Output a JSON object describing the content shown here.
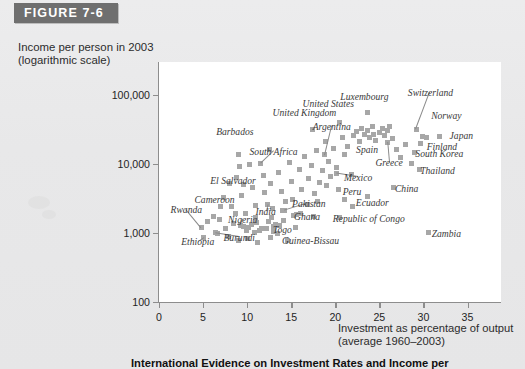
{
  "figure": {
    "banner_label": "FIGURE 7-6",
    "caption": "International Evidence on Investment Rates and Income per"
  },
  "axes": {
    "y_title_line1": "Income per person in 2003",
    "y_title_line2": "(logarithmic scale)",
    "x_title_line1": "Investment as percentage of output",
    "x_title_line2": "(average 1960–2003)",
    "y_ticks": [
      "100,000",
      "10,000",
      "1,000",
      "100"
    ],
    "y_tick_values": [
      100000,
      10000,
      1000,
      100
    ],
    "x_ticks": [
      "0",
      "5",
      "10",
      "15",
      "20",
      "25",
      "30",
      "35"
    ],
    "x_tick_values": [
      0,
      5,
      10,
      15,
      20,
      25,
      30,
      35
    ]
  },
  "colors": {
    "banner": "#6f6f6f",
    "point": "#a7a7a7",
    "axis": "#8d8d8d",
    "plot_background": "#ffffff",
    "page_background": "#e9e9e9"
  },
  "chart_data": {
    "type": "scatter",
    "title": "International Evidence on Investment Rates and Income per",
    "xlabel": "Investment as percentage of output (average 1960-2003)",
    "ylabel": "Income per person in 2003 (logarithmic scale)",
    "yscale": "log",
    "xlim": [
      0,
      38.8
    ],
    "ylim": [
      100,
      300000
    ],
    "grid": false,
    "legend": null,
    "labeled_points": [
      {
        "name": "Switzerland",
        "x": 29.2,
        "y": 32000,
        "lx": 30.8,
        "ly": 112000,
        "leader": true
      },
      {
        "name": "Norway",
        "x": 29.2,
        "y": 32000,
        "lx": 32.6,
        "ly": 52000,
        "leader": false
      },
      {
        "name": "Luxembourg",
        "x": 23.6,
        "y": 55000,
        "lx": 23.3,
        "ly": 95000,
        "leader": false
      },
      {
        "name": "United States",
        "x": 20.5,
        "y": 40000,
        "lx": 19.2,
        "ly": 76000,
        "leader": false
      },
      {
        "name": "Japan",
        "x": 31.8,
        "y": 25000,
        "lx": 34.3,
        "ly": 26000,
        "leader": false
      },
      {
        "name": "Finland",
        "x": 29.7,
        "y": 20000,
        "lx": 32.1,
        "ly": 18500,
        "leader": false
      },
      {
        "name": "South Korea",
        "x": 29.0,
        "y": 14500,
        "lx": 31.8,
        "ly": 14200,
        "leader": false
      },
      {
        "name": "United Kingdom",
        "x": 17.4,
        "y": 32000,
        "lx": 16.5,
        "ly": 56000,
        "leader": false
      },
      {
        "name": "Argentina",
        "x": 18.8,
        "y": 13500,
        "lx": 19.6,
        "ly": 36000,
        "leader": true
      },
      {
        "name": "Spain",
        "x": 24.3,
        "y": 27000,
        "lx": 23.6,
        "ly": 16500,
        "leader": false
      },
      {
        "name": "Greece",
        "x": 25.9,
        "y": 20500,
        "lx": 26.1,
        "ly": 10500,
        "leader": true
      },
      {
        "name": "Thailand",
        "x": 29.6,
        "y": 8200,
        "lx": 31.6,
        "ly": 8100,
        "leader": false
      },
      {
        "name": "Barbados",
        "x": 9.0,
        "y": 13800,
        "lx": 8.6,
        "ly": 30000,
        "leader": false
      },
      {
        "name": "South Africa",
        "x": 11.5,
        "y": 10200,
        "lx": 13.0,
        "ly": 15500,
        "leader": true
      },
      {
        "name": "Mexico",
        "x": 20.1,
        "y": 7300,
        "lx": 22.6,
        "ly": 6500,
        "leader": true
      },
      {
        "name": "China",
        "x": 26.6,
        "y": 4600,
        "lx": 28.1,
        "ly": 4500,
        "leader": false
      },
      {
        "name": "Peru",
        "x": 20.4,
        "y": 4200,
        "lx": 21.9,
        "ly": 4100,
        "leader": false
      },
      {
        "name": "Ecuador",
        "x": 23.6,
        "y": 3400,
        "lx": 24.2,
        "ly": 2850,
        "leader": false
      },
      {
        "name": "El Salvador",
        "x": 9.6,
        "y": 5000,
        "lx": 8.4,
        "ly": 5900,
        "leader": false
      },
      {
        "name": "Cameroon",
        "x": 7.0,
        "y": 2400,
        "lx": 6.3,
        "ly": 3150,
        "leader": false
      },
      {
        "name": "Pakistan",
        "x": 14.2,
        "y": 2100,
        "lx": 17.0,
        "ly": 2700,
        "leader": true
      },
      {
        "name": "India",
        "x": 12.3,
        "y": 2600,
        "lx": 12.1,
        "ly": 2050,
        "leader": true
      },
      {
        "name": "Ghana",
        "x": 15.3,
        "y": 1800,
        "lx": 16.8,
        "ly": 1750,
        "leader": false
      },
      {
        "name": "Nigeria",
        "x": 9.2,
        "y": 1300,
        "lx": 9.5,
        "ly": 1600,
        "leader": true
      },
      {
        "name": "Rwanda",
        "x": 4.8,
        "y": 1200,
        "lx": 3.1,
        "ly": 2200,
        "leader": true
      },
      {
        "name": "Togo",
        "x": 13.0,
        "y": 1250,
        "lx": 14.0,
        "ly": 1150,
        "leader": false
      },
      {
        "name": "Burundi",
        "x": 6.4,
        "y": 1000,
        "lx": 9.1,
        "ly": 880,
        "leader": true
      },
      {
        "name": "Ethiopia",
        "x": 5.1,
        "y": 870,
        "lx": 4.4,
        "ly": 760,
        "leader": true
      },
      {
        "name": "Guinea-Bissau",
        "x": 14.6,
        "y": 790,
        "lx": 17.2,
        "ly": 780,
        "leader": false
      },
      {
        "name": "Republic of Congo",
        "x": 20.5,
        "y": 1650,
        "lx": 23.8,
        "ly": 1640,
        "leader": false
      },
      {
        "name": "Zambia",
        "x": 30.6,
        "y": 1020,
        "lx": 32.6,
        "ly": 1015,
        "leader": false
      }
    ],
    "unlabeled_points": [
      {
        "x": 5.5,
        "y": 1450
      },
      {
        "x": 6.2,
        "y": 1750
      },
      {
        "x": 6.6,
        "y": 980
      },
      {
        "x": 7.3,
        "y": 3300
      },
      {
        "x": 7.6,
        "y": 1150
      },
      {
        "x": 8.0,
        "y": 5200
      },
      {
        "x": 8.2,
        "y": 2450
      },
      {
        "x": 8.5,
        "y": 1380
      },
      {
        "x": 8.8,
        "y": 6400
      },
      {
        "x": 9.1,
        "y": 9100
      },
      {
        "x": 9.4,
        "y": 3500
      },
      {
        "x": 9.8,
        "y": 1900
      },
      {
        "x": 10.1,
        "y": 1200
      },
      {
        "x": 10.3,
        "y": 9800
      },
      {
        "x": 10.6,
        "y": 4500
      },
      {
        "x": 10.9,
        "y": 2500
      },
      {
        "x": 11.1,
        "y": 1420
      },
      {
        "x": 11.4,
        "y": 1080
      },
      {
        "x": 11.8,
        "y": 6900
      },
      {
        "x": 12.0,
        "y": 3800
      },
      {
        "x": 12.2,
        "y": 1150
      },
      {
        "x": 12.5,
        "y": 16000
      },
      {
        "x": 12.7,
        "y": 5200
      },
      {
        "x": 12.9,
        "y": 2300
      },
      {
        "x": 13.2,
        "y": 1320
      },
      {
        "x": 13.4,
        "y": 980
      },
      {
        "x": 13.6,
        "y": 7600
      },
      {
        "x": 13.9,
        "y": 4000
      },
      {
        "x": 14.1,
        "y": 1500
      },
      {
        "x": 14.4,
        "y": 2850
      },
      {
        "x": 14.8,
        "y": 10500
      },
      {
        "x": 15.0,
        "y": 5600
      },
      {
        "x": 15.2,
        "y": 3100
      },
      {
        "x": 15.6,
        "y": 1850
      },
      {
        "x": 15.9,
        "y": 8400
      },
      {
        "x": 16.2,
        "y": 4300
      },
      {
        "x": 16.5,
        "y": 13000
      },
      {
        "x": 16.8,
        "y": 2600
      },
      {
        "x": 17.0,
        "y": 6200
      },
      {
        "x": 17.3,
        "y": 9500
      },
      {
        "x": 17.6,
        "y": 3700
      },
      {
        "x": 17.9,
        "y": 15500
      },
      {
        "x": 18.2,
        "y": 5400
      },
      {
        "x": 18.5,
        "y": 8000
      },
      {
        "x": 18.9,
        "y": 21000
      },
      {
        "x": 19.2,
        "y": 11000
      },
      {
        "x": 19.5,
        "y": 6600
      },
      {
        "x": 19.8,
        "y": 16500
      },
      {
        "x": 20.1,
        "y": 9000
      },
      {
        "x": 20.8,
        "y": 24000
      },
      {
        "x": 21.1,
        "y": 13500
      },
      {
        "x": 21.4,
        "y": 18000
      },
      {
        "x": 21.8,
        "y": 7000
      },
      {
        "x": 22.1,
        "y": 26000
      },
      {
        "x": 22.4,
        "y": 30000
      },
      {
        "x": 22.7,
        "y": 21000
      },
      {
        "x": 23.0,
        "y": 33000
      },
      {
        "x": 23.3,
        "y": 27000
      },
      {
        "x": 23.6,
        "y": 31000
      },
      {
        "x": 23.9,
        "y": 24000
      },
      {
        "x": 24.2,
        "y": 35000
      },
      {
        "x": 24.6,
        "y": 22000
      },
      {
        "x": 25.0,
        "y": 29000
      },
      {
        "x": 25.3,
        "y": 33000
      },
      {
        "x": 25.6,
        "y": 26000
      },
      {
        "x": 25.9,
        "y": 31000
      },
      {
        "x": 26.2,
        "y": 35000
      },
      {
        "x": 26.5,
        "y": 23000
      },
      {
        "x": 26.9,
        "y": 16000
      },
      {
        "x": 27.4,
        "y": 12500
      },
      {
        "x": 28.0,
        "y": 19000
      },
      {
        "x": 28.6,
        "y": 10000
      },
      {
        "x": 29.9,
        "y": 25000
      },
      {
        "x": 30.4,
        "y": 24500
      },
      {
        "x": 18.0,
        "y": 2900
      },
      {
        "x": 19.0,
        "y": 4800
      },
      {
        "x": 16.0,
        "y": 1900
      },
      {
        "x": 13.0,
        "y": 1050
      },
      {
        "x": 10.0,
        "y": 840
      },
      {
        "x": 11.0,
        "y": 1650
      },
      {
        "x": 7.9,
        "y": 900
      },
      {
        "x": 9.6,
        "y": 1250
      },
      {
        "x": 12.4,
        "y": 1450
      },
      {
        "x": 10.5,
        "y": 1320
      },
      {
        "x": 11.6,
        "y": 1180
      },
      {
        "x": 8.7,
        "y": 1900
      },
      {
        "x": 12.8,
        "y": 1700
      },
      {
        "x": 14.0,
        "y": 2150
      },
      {
        "x": 6.9,
        "y": 1560
      },
      {
        "x": 21.0,
        "y": 3100
      },
      {
        "x": 22.0,
        "y": 2400
      },
      {
        "x": 15.5,
        "y": 1220
      },
      {
        "x": 17.5,
        "y": 1750
      },
      {
        "x": 9.0,
        "y": 780
      },
      {
        "x": 11.2,
        "y": 720
      },
      {
        "x": 12.6,
        "y": 870
      },
      {
        "x": 10.8,
        "y": 1000
      },
      {
        "x": 9.9,
        "y": 1100
      },
      {
        "x": 13.7,
        "y": 1300
      }
    ]
  }
}
